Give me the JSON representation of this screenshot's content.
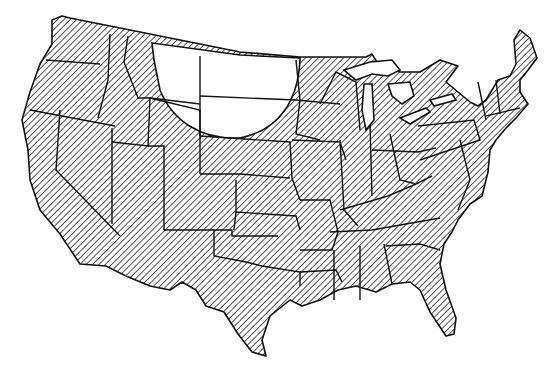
{
  "map": {
    "type": "choropleth-hatched",
    "region": "Contiguous United States",
    "colors": {
      "background": "#ffffff",
      "stroke": "#111111",
      "hatch": "#222222",
      "unhatched": "#ffffff"
    },
    "hatched_area": "Most of the contiguous United States",
    "unhatched_area": "Curved region covering northern/central Montana, North Dakota, and northern South Dakota"
  }
}
